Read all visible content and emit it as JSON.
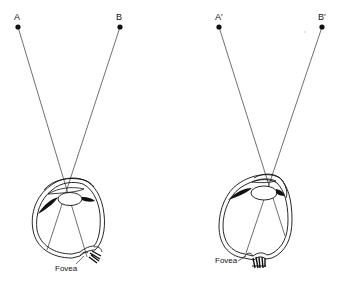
{
  "diagram": {
    "type": "eye-optics-comparison",
    "panels": [
      {
        "id": "left",
        "points": [
          {
            "label": "A",
            "x": 18,
            "y": 27
          },
          {
            "label": "B",
            "x": 120,
            "y": 27
          }
        ],
        "fovea_label": "Fovea"
      },
      {
        "id": "right",
        "points": [
          {
            "label": "A′",
            "x": 219,
            "y": 27
          },
          {
            "label": "B′",
            "x": 322,
            "y": 27
          }
        ],
        "fovea_label": "Fovea"
      }
    ],
    "colors": {
      "ink": "#111111",
      "background": "#ffffff",
      "ray": "#333333"
    }
  }
}
